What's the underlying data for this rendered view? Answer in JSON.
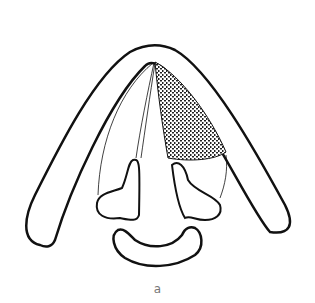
{
  "figure": {
    "caption": "a",
    "colors": {
      "stroke": "#111111",
      "stipple": "#222222",
      "background": "#ffffff"
    }
  }
}
